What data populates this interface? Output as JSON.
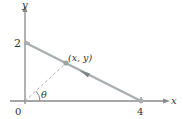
{
  "figure": {
    "type": "geometry-diagram",
    "axes": {
      "x_label": "x",
      "y_label": "y",
      "origin_label": "0",
      "x_tick_label": "4",
      "y_tick_label": "2"
    },
    "segment": {
      "from": [
        0,
        2
      ],
      "to": [
        4,
        0
      ],
      "color": "#a9aeb0"
    },
    "point": {
      "label": "(x, y)",
      "color": "#9aa3a6"
    },
    "angle_label": "θ",
    "colors": {
      "axis": "#888888",
      "text": "#333333",
      "dashed": "#b0b0b0"
    }
  }
}
